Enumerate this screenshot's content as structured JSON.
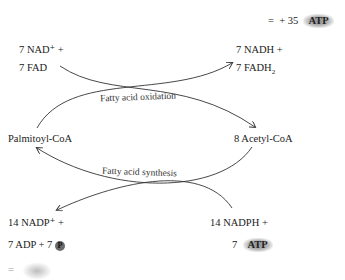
{
  "summary": {
    "equals": "=",
    "plus": "+",
    "count": "35",
    "atp": "ATP"
  },
  "oxidation": {
    "inputs": {
      "line1": "7 NAD⁺ +",
      "line2": "7  FAD"
    },
    "outputs": {
      "line1": "7 NADH +",
      "line2_prefix": "7 FADH",
      "line2_sub": "2"
    },
    "label": "Fatty acid oxidation"
  },
  "left_node": "Palmitoyl-CoA",
  "right_node": "8 Acetyl-CoA",
  "synthesis": {
    "label": "Fatty acid synthesis",
    "outputs": {
      "line1": "14 NADP⁺ +",
      "line2_prefix": "7 ADP  +  7",
      "phosphate": "P"
    },
    "inputs": {
      "line1": "14 NADPH  +",
      "line2_count": "7",
      "atp": "ATP"
    }
  },
  "bottom_cut": {
    "text": "="
  }
}
